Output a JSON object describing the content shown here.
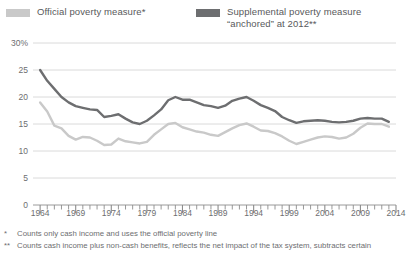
{
  "legend": {
    "official": {
      "label": "Official poverty measure*",
      "color": "#c9c9c9",
      "swatch_name": "legend-swatch-official"
    },
    "supplemental": {
      "label": "Supplemental poverty measure\n“anchored” at 2012**",
      "color": "#6d6e70",
      "swatch_name": "legend-swatch-supplemental"
    }
  },
  "footnotes": [
    {
      "mark": "*",
      "text": "Counts only cash income and uses the official poverty line"
    },
    {
      "mark": "**",
      "text": "Counts cash income plus non-cash benefits, reflects the net impact of the tax system, subtracts certain"
    }
  ],
  "chart_data": {
    "type": "line",
    "title": "",
    "xlabel": "",
    "ylabel": "",
    "xlim": [
      1963,
      2014
    ],
    "ylim": [
      0,
      30
    ],
    "yticks": [
      0,
      5,
      10,
      15,
      20,
      25,
      30
    ],
    "ytick_labels": [
      "0",
      "5",
      "10",
      "15",
      "20",
      "25",
      "30%"
    ],
    "xticks": [
      1964,
      1969,
      1974,
      1979,
      1984,
      1989,
      1994,
      1999,
      2004,
      2009,
      2014
    ],
    "xtick_labels": [
      "1964",
      "1969",
      "1974",
      "1979",
      "1984",
      "1989",
      "1994",
      "1999",
      "2004",
      "2009",
      "2014"
    ],
    "minor_xticks_every": 1,
    "grid": true,
    "grid_axis": "y",
    "legend_position": "top",
    "x": [
      1964,
      1965,
      1966,
      1967,
      1968,
      1969,
      1970,
      1971,
      1972,
      1973,
      1974,
      1975,
      1976,
      1977,
      1978,
      1979,
      1980,
      1981,
      1982,
      1983,
      1984,
      1985,
      1986,
      1987,
      1988,
      1989,
      1990,
      1991,
      1992,
      1993,
      1994,
      1995,
      1996,
      1997,
      1998,
      1999,
      2000,
      2001,
      2002,
      2003,
      2004,
      2005,
      2006,
      2007,
      2008,
      2009,
      2010,
      2011,
      2012,
      2013
    ],
    "series": [
      {
        "name": "Official poverty measure*",
        "color": "#c9c9c9",
        "values": [
          19.0,
          17.3,
          14.7,
          14.2,
          12.8,
          12.1,
          12.6,
          12.5,
          11.9,
          11.1,
          11.2,
          12.3,
          11.8,
          11.6,
          11.4,
          11.7,
          13.0,
          14.0,
          15.0,
          15.2,
          14.4,
          14.0,
          13.6,
          13.4,
          13.0,
          12.8,
          13.5,
          14.2,
          14.8,
          15.1,
          14.5,
          13.8,
          13.7,
          13.3,
          12.7,
          11.9,
          11.3,
          11.7,
          12.1,
          12.5,
          12.7,
          12.6,
          12.3,
          12.5,
          13.2,
          14.3,
          15.1,
          15.0,
          15.0,
          14.5
        ]
      },
      {
        "name": "Supplemental poverty measure “anchored” at 2012**",
        "color": "#6d6e70",
        "values": [
          25.0,
          23.0,
          21.5,
          20.0,
          19.0,
          18.3,
          18.0,
          17.7,
          17.6,
          16.3,
          16.5,
          16.8,
          16.0,
          15.3,
          15.0,
          15.6,
          16.6,
          17.7,
          19.4,
          20.0,
          19.5,
          19.5,
          19.0,
          18.5,
          18.3,
          18.0,
          18.4,
          19.3,
          19.7,
          20.0,
          19.3,
          18.5,
          18.0,
          17.4,
          16.3,
          15.7,
          15.2,
          15.5,
          15.6,
          15.7,
          15.6,
          15.4,
          15.3,
          15.4,
          15.6,
          16.0,
          16.1,
          16.0,
          16.0,
          15.4
        ]
      }
    ]
  }
}
